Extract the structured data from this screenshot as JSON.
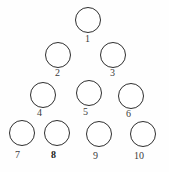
{
  "figure": {
    "name": "bowling-pin-triangle-diagram",
    "background_color": "#fefefe",
    "circle_stroke_color": "#2e2e2e",
    "circle_fill_color": "#ffffff",
    "label_color": "#3b3b3b",
    "label_bold_color": "#1a1a1a",
    "circle_stroke_width_px": 1.5,
    "width_px": 169,
    "height_px": 172
  },
  "chart_data": {
    "type": "scatter",
    "title": "",
    "subtitle": "",
    "xlabel": "",
    "ylabel": "",
    "grid": false,
    "legend": null,
    "xlim": [
      0,
      169
    ],
    "ylim": [
      0,
      172
    ],
    "note": "Ten outlined circles arranged as a 1-2-3-4 triangular bowling-pin layout, each annotated with its number beneath it.",
    "rows": [
      {
        "row": 1,
        "count": 1,
        "labels": [
          "1"
        ]
      },
      {
        "row": 2,
        "count": 2,
        "labels": [
          "2",
          "3"
        ]
      },
      {
        "row": 3,
        "count": 3,
        "labels": [
          "4",
          "5",
          "6"
        ]
      },
      {
        "row": 4,
        "count": 4,
        "labels": [
          "7",
          "8",
          "9",
          "10"
        ]
      }
    ],
    "points": [
      {
        "label": "1",
        "cx": 88,
        "cy": 20,
        "r": 13
      },
      {
        "label": "2",
        "cx": 58,
        "cy": 55,
        "r": 13
      },
      {
        "label": "3",
        "cx": 113,
        "cy": 55,
        "r": 13
      },
      {
        "label": "4",
        "cx": 43,
        "cy": 95,
        "r": 13
      },
      {
        "label": "5",
        "cx": 89,
        "cy": 93,
        "r": 13
      },
      {
        "label": "6",
        "cx": 131,
        "cy": 96,
        "r": 13
      },
      {
        "label": "7",
        "cx": 22,
        "cy": 133,
        "r": 13
      },
      {
        "label": "8",
        "cx": 57,
        "cy": 133,
        "r": 13
      },
      {
        "label": "9",
        "cx": 99,
        "cy": 134,
        "r": 13
      },
      {
        "label": "10",
        "cx": 143,
        "cy": 134,
        "r": 13
      }
    ]
  },
  "nodes": [
    {
      "id": "circle-1",
      "label": "1",
      "cx": 88,
      "cy": 20,
      "r": 13,
      "label_x": 85,
      "label_y": 34,
      "bold": false
    },
    {
      "id": "circle-2",
      "label": "2",
      "cx": 58,
      "cy": 55,
      "r": 13,
      "label_x": 55,
      "label_y": 68,
      "bold": false
    },
    {
      "id": "circle-3",
      "label": "3",
      "cx": 113,
      "cy": 55,
      "r": 13,
      "label_x": 110,
      "label_y": 68,
      "bold": false
    },
    {
      "id": "circle-4",
      "label": "4",
      "cx": 43,
      "cy": 95,
      "r": 13,
      "label_x": 37,
      "label_y": 108,
      "bold": false
    },
    {
      "id": "circle-5",
      "label": "5",
      "cx": 89,
      "cy": 93,
      "r": 13,
      "label_x": 83,
      "label_y": 107,
      "bold": false
    },
    {
      "id": "circle-6",
      "label": "6",
      "cx": 131,
      "cy": 96,
      "r": 13,
      "label_x": 126,
      "label_y": 109,
      "bold": false
    },
    {
      "id": "circle-7",
      "label": "7",
      "cx": 22,
      "cy": 133,
      "r": 13,
      "label_x": 15,
      "label_y": 150,
      "bold": false
    },
    {
      "id": "circle-8",
      "label": "8",
      "cx": 57,
      "cy": 133,
      "r": 13,
      "label_x": 51,
      "label_y": 150,
      "bold": true
    },
    {
      "id": "circle-9",
      "label": "9",
      "cx": 99,
      "cy": 134,
      "r": 13,
      "label_x": 93,
      "label_y": 151,
      "bold": false
    },
    {
      "id": "circle-10",
      "label": "10",
      "cx": 143,
      "cy": 134,
      "r": 13,
      "label_x": 134,
      "label_y": 151,
      "bold": false
    }
  ]
}
